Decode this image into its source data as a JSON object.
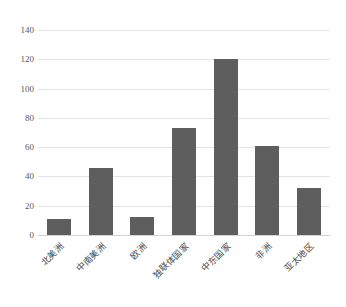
{
  "chart_data": {
    "type": "bar",
    "title": "",
    "subtitle": "",
    "xlabel": "",
    "ylabel": "",
    "categories": [
      "北美洲",
      "中南美洲",
      "欧洲",
      "独联体国家",
      "中东国家",
      "非洲",
      "亚太地区"
    ],
    "values": [
      11,
      46,
      12,
      73,
      120,
      61,
      32
    ],
    "series": [
      {
        "name": "",
        "values": [
          11,
          46,
          12,
          73,
          120,
          61,
          32
        ]
      }
    ],
    "ylim": [
      0,
      140
    ],
    "yticks": [
      0,
      20,
      40,
      60,
      80,
      100,
      120,
      140
    ],
    "ytick_labels": [
      "0",
      "20",
      "40",
      "60",
      "80",
      "100",
      "120",
      "140"
    ],
    "grid": true,
    "grid_axis": "y",
    "legend": false,
    "legend_position": "none",
    "annotations": [],
    "colors": {
      "bar": "#5e5e5e",
      "gridline": "#e4e4e4",
      "baseline": "#d4d4d4",
      "tick_text": "#5a5a5a",
      "label_text": "#4a4a4a",
      "background": "#ffffff"
    },
    "xlabel_rotation_deg": -45
  }
}
